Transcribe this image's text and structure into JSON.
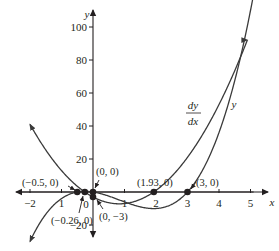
{
  "chart_data": {
    "type": "line",
    "title": "",
    "xlabel": "x",
    "ylabel": "y",
    "xlim": [
      -2.2,
      5.4
    ],
    "ylim": [
      -26,
      108
    ],
    "grid": false,
    "x_ticks": [
      -2,
      -1,
      0,
      1,
      2,
      3,
      4,
      5
    ],
    "x_tick_labels": [
      "−2",
      "1",
      "0",
      "1",
      "2",
      "3",
      "4",
      "5"
    ],
    "y_ticks": [
      -20,
      20,
      40,
      60,
      80,
      100
    ],
    "y_tick_labels": [
      "−20",
      "20",
      "40",
      "60",
      "80",
      "100"
    ],
    "series": [
      {
        "name": "y",
        "expression": "2x^3 - 5x^2 - 3x",
        "x_range": [
          -2,
          5.12
        ],
        "color": "#231f20",
        "label": "y",
        "sample_points": [
          [
            -2,
            -30
          ],
          [
            -1,
            -4
          ],
          [
            -0.5,
            0
          ],
          [
            0,
            0
          ],
          [
            1,
            -6
          ],
          [
            2,
            -10
          ],
          [
            3,
            0
          ],
          [
            4,
            36
          ],
          [
            5,
            110
          ]
        ]
      },
      {
        "name": "dy/dx",
        "expression": "6x^2 - 10x - 3",
        "x_range": [
          -2,
          4.9
        ],
        "color": "#231f20",
        "label_top": "dy",
        "label_bottom": "dx",
        "sample_points": [
          [
            -2,
            41
          ],
          [
            -1,
            13
          ],
          [
            -0.26,
            0
          ],
          [
            0,
            -3
          ],
          [
            1,
            -7
          ],
          [
            1.93,
            0
          ],
          [
            3,
            21
          ],
          [
            4,
            53
          ],
          [
            5,
            97
          ]
        ]
      }
    ],
    "annotations": [
      {
        "x": -0.5,
        "y": 0,
        "text": "(−0.5, 0)"
      },
      {
        "x": -0.26,
        "y": 0,
        "text": "(−0.26, 0)"
      },
      {
        "x": 0,
        "y": 0,
        "text": "(0, 0)"
      },
      {
        "x": 0,
        "y": -3,
        "text": "(0, −3)"
      },
      {
        "x": 1.93,
        "y": 0,
        "text": "(1.93, 0)"
      },
      {
        "x": 3,
        "y": 0,
        "text": "(3, 0)"
      }
    ]
  }
}
